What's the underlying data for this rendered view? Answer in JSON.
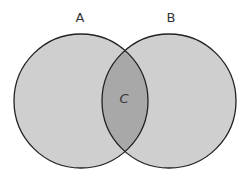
{
  "diagram": {
    "type": "venn",
    "sets": [
      {
        "label": "A",
        "cx": 81,
        "cy": 101,
        "r": 67
      },
      {
        "label": "B",
        "cx": 169,
        "cy": 101,
        "r": 67
      }
    ],
    "intersection": {
      "label": "C"
    },
    "colors": {
      "background": "#ffffff",
      "circle_fill": "#cfcfcf",
      "intersection_fill": "#a8a8a8",
      "stroke": "#222222",
      "label": "#333333"
    }
  }
}
